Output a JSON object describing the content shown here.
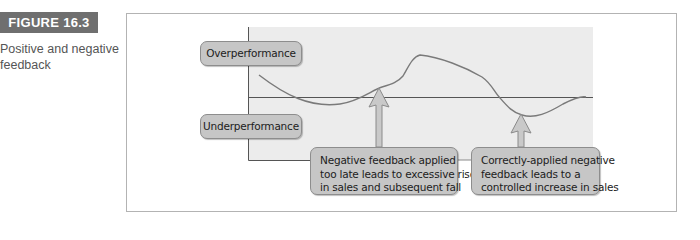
{
  "figure": {
    "badge": "FIGURE 16.3",
    "caption": "Positive and negative feedback"
  },
  "diagram": {
    "labels": {
      "overperformance": "Overperformance",
      "underperformance": "Underperformance"
    },
    "callouts": [
      {
        "lines": [
          "Negative feedback applied",
          "too late leads to excessive rise",
          "in sales and subsequent fall"
        ]
      },
      {
        "lines": [
          "Correctly-applied negative",
          "feedback leads to a",
          "controlled increase in sales"
        ]
      }
    ],
    "colors": {
      "badge_bg": "#6f6f6f",
      "plot_bg": "#ececec",
      "pill_bg": "#c6c6c6",
      "pill_border": "#8d8d8d",
      "curve": "#7a7a7a",
      "baseline": "#555555",
      "arrow_fill": "#c9c9c9",
      "arrow_stroke": "#8a8a8a"
    }
  }
}
